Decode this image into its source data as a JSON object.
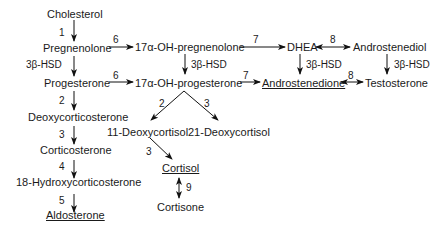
{
  "diagram": {
    "nodes": {
      "cholesterol": "Cholesterol",
      "pregnenolone": "Pregnenolone",
      "oh_pregnenolone": "17α-OH-pregnenolone",
      "dhea": "DHEA",
      "androstenediol": "Androstenediol",
      "progesterone": "Progesterone",
      "oh_progesterone": "17α-OH-progesterone",
      "androstenedione": "Androstenedione",
      "testosterone": "Testosterone",
      "deoxycorticosterone": "Deoxycorticosterone",
      "deoxycortisol_11": "11-Deoxycortisol",
      "deoxycortisol_21": "21-Deoxycortisol",
      "corticosterone": "Corticosterone",
      "cortisol": "Cortisol",
      "hydroxycorticosterone_18": "18-Hydroxycorticosterone",
      "cortisone": "Cortisone",
      "aldosterone": "Aldosterone"
    },
    "underlined": [
      "Androstenedione",
      "Cortisol",
      "Aldosterone"
    ],
    "edges": {
      "chol_preg": "1",
      "preg_ohpreg": "6",
      "ohpreg_dhea": "7",
      "dhea_androstenediol": "8",
      "preg_prog": "3β-HSD",
      "ohpreg_ohprog": "3β-HSD",
      "dhea_androstenedione": "3β-HSD",
      "androstenediol_testosterone": "3β-HSD",
      "prog_ohprog": "6",
      "ohprog_androstenedione": "7",
      "androstenedione_testosterone": "8",
      "prog_doc": "2",
      "ohprog_11doc": "2",
      "ohprog_21doc": "3",
      "doc_cortico": "3",
      "11doc_cortisol": "3",
      "cortico_18oh": "4",
      "cortisol_cortisone": "9",
      "18oh_aldo": "5"
    }
  }
}
